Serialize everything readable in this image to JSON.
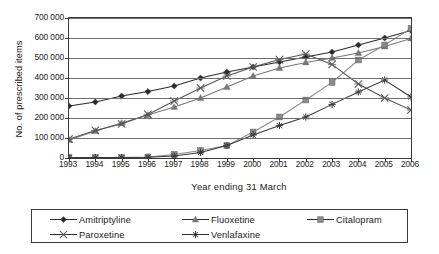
{
  "chart_data": {
    "type": "line",
    "title": "",
    "xlabel": "Year ending 31 March",
    "ylabel": "No. of prescribed items",
    "x": [
      1993,
      1994,
      1995,
      1996,
      1997,
      1998,
      1999,
      2000,
      2001,
      2002,
      2003,
      2004,
      2005,
      2006
    ],
    "xtick_labels": [
      "1993",
      "1994",
      "1995",
      "1996",
      "1997",
      "1998",
      "1999",
      "2000",
      "2001",
      "2002",
      "2003",
      "2004",
      "2005",
      "2006"
    ],
    "ylim": [
      0,
      700000
    ],
    "ytick_labels": [
      "0",
      "100 000",
      "200 000",
      "300 000",
      "400 000",
      "500 000",
      "600 000",
      "700 000"
    ],
    "ytick_values": [
      0,
      100000,
      200000,
      300000,
      400000,
      500000,
      600000,
      700000
    ],
    "grid": true,
    "legend_position": "bottom",
    "series": [
      {
        "name": "Amitriptyline",
        "marker": "diamond",
        "color": "#2b2b2b",
        "values": [
          260000,
          280000,
          310000,
          332000,
          360000,
          400000,
          430000,
          455000,
          480000,
          505000,
          530000,
          565000,
          600000,
          638000
        ]
      },
      {
        "name": "Fluoxetine",
        "marker": "triangle",
        "color": "#777777",
        "values": [
          90000,
          135000,
          175000,
          215000,
          255000,
          300000,
          355000,
          410000,
          450000,
          478000,
          500000,
          525000,
          558000,
          598000
        ]
      },
      {
        "name": "Citalopram",
        "marker": "square",
        "color": "#8a8a8a",
        "values": [
          2000,
          2000,
          2000,
          5000,
          18000,
          38000,
          62000,
          130000,
          205000,
          290000,
          378000,
          490000,
          565000,
          648000
        ]
      },
      {
        "name": "Paroxetine",
        "marker": "x",
        "color": "#555555",
        "values": [
          95000,
          138000,
          170000,
          218000,
          285000,
          350000,
          410000,
          455000,
          492000,
          520000,
          468000,
          370000,
          300000,
          240000
        ]
      },
      {
        "name": "Venlafaxine",
        "marker": "star",
        "color": "#3a3a3a",
        "values": [
          2000,
          2000,
          2000,
          4000,
          10000,
          28000,
          62000,
          115000,
          162000,
          205000,
          268000,
          330000,
          390000,
          305000
        ]
      }
    ]
  },
  "legend": {
    "entries": [
      {
        "label": "Amitriptyline",
        "marker": "diamond"
      },
      {
        "label": "Fluoxetine",
        "marker": "triangle"
      },
      {
        "label": "Citalopram",
        "marker": "square"
      },
      {
        "label": "Paroxetine",
        "marker": "x"
      },
      {
        "label": "Venlafaxine",
        "marker": "star"
      }
    ]
  }
}
